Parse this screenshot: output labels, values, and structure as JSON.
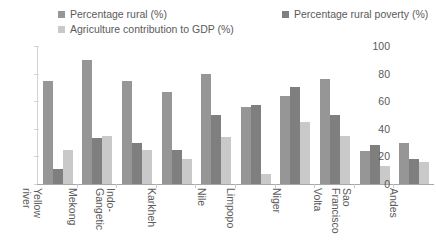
{
  "colors": {
    "series1": "#969696",
    "series2": "#7f7f7f",
    "series3": "#c9c9c9",
    "axis": "#a8a8a8",
    "gridline": "#d4d4d4",
    "text": "#5a5a5a",
    "background": "#ffffff"
  },
  "legend": {
    "entries": [
      {
        "label": "Percentage rural (%)",
        "swatch": "#969696",
        "icon": "legend-swatch-square"
      },
      {
        "label": "Percentage rural poverty (%)",
        "swatch": "#7f7f7f",
        "icon": "legend-swatch-square"
      },
      {
        "label": "Agriculture contribution to GDP (%)",
        "swatch": "#c9c9c9",
        "icon": "legend-swatch-square"
      }
    ]
  },
  "axis": {
    "y_ticks": [
      "100",
      "80",
      "60",
      "40",
      "20",
      "0"
    ]
  },
  "chart_data": {
    "type": "bar",
    "title": "",
    "subtitle": "",
    "xlabel": "",
    "ylabel": "",
    "ylim": [
      0,
      100
    ],
    "ytick_step": 20,
    "grid": false,
    "legend_position": "top",
    "categories": [
      "Yellow river",
      "Mekong",
      "Indo-Gangetic",
      "Karkheh",
      "Nile",
      "Limpopo",
      "Niger",
      "Volta",
      "Sao Francisco",
      "Andes"
    ],
    "category_lines": [
      [
        "Yellow",
        "river"
      ],
      [
        "Mekong",
        ""
      ],
      [
        "Indo-",
        "Gangetic"
      ],
      [
        "Karkheh",
        ""
      ],
      [
        "Nile",
        ""
      ],
      [
        "Limpopo",
        ""
      ],
      [
        "Niger",
        ""
      ],
      [
        "Volta",
        ""
      ],
      [
        "Sao",
        "Francisco"
      ],
      [
        "Andes",
        ""
      ]
    ],
    "series": [
      {
        "name": "Percentage rural (%)",
        "color": "#969696",
        "values": [
          75,
          90,
          75,
          67,
          80,
          56,
          64,
          76,
          24,
          30
        ]
      },
      {
        "name": "Percentage rural poverty (%)",
        "color": "#7f7f7f",
        "values": [
          11,
          33,
          30,
          25,
          50,
          57,
          70,
          50,
          28,
          18
        ]
      },
      {
        "name": "Agriculture contribution to GDP (%)",
        "color": "#c9c9c9",
        "values": [
          25,
          35,
          25,
          18,
          34,
          7,
          45,
          35,
          13,
          16
        ]
      }
    ]
  }
}
